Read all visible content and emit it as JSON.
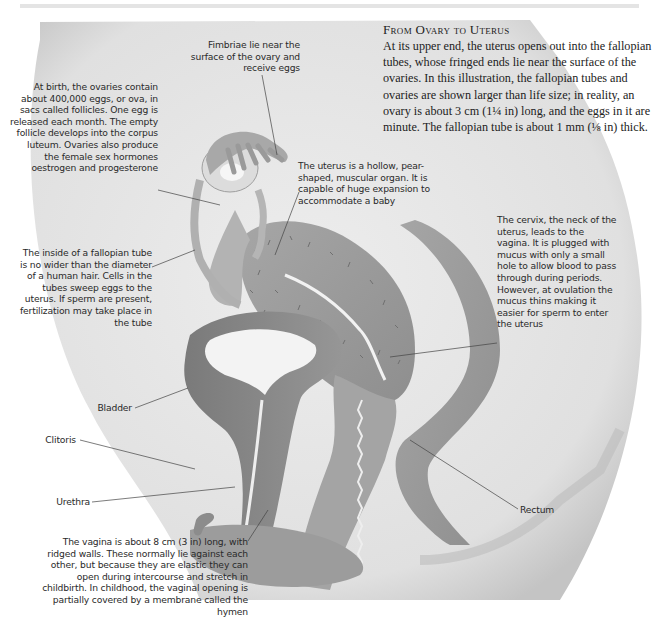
{
  "page": {
    "title": "From Ovary to Uterus",
    "intro": "At its upper end, the uterus opens out into the fallopian tubes, whose fringed ends lie near the surface of the ovaries. In this illustration, the fallopian tubes and ovaries are shown larger than life size; in reality, an ovary is about 3 cm (1¼ in) long, and the eggs in it are minute. The fallopian tube is about 1 mm (⅛ in) thick."
  },
  "labels": {
    "fimbriae": "Fimbriae lie near the surface of the ovary and receive eggs",
    "ovaries": "At birth, the ovaries contain about 400,000 eggs, or ova, in sacs called follicles. One egg is released each month. The empty follicle develops into the corpus luteum. Ovaries also produce the female sex hormones oestrogen and progesterone",
    "uterus": "The uterus is a hollow, pear-shaped, muscular organ. It is capable of huge expansion to accommodate a baby",
    "fallopian_tube": "The inside of a fallopian tube is no wider than the diameter of a human hair. Cells in the tubes sweep eggs to the uterus. If sperm are present, fertilization may take place in the tube",
    "cervix": "The cervix, the neck of the uterus, leads to the vagina. It is plugged with mucus with only a small hole to allow blood to pass through during periods. However, at ovulation the mucus thins making it easier for sperm to enter the uterus",
    "bladder": "Bladder",
    "clitoris": "Clitoris",
    "urethra": "Urethra",
    "rectum": "Rectum",
    "vagina": "The vagina is about 8 cm (3 in) long, with ridged walls. These normally lie against each other, but because they are elastic they can open during intercourse and stretch in childbirth. In childhood, the vaginal opening is partially covered by a membrane called the hymen"
  },
  "colors": {
    "body_fill": "#e6e6e6",
    "organ_dark": "#8a8a8a",
    "organ_mid": "#a8a8a8",
    "leader_line": "#444444",
    "text": "#2a2a2a"
  }
}
